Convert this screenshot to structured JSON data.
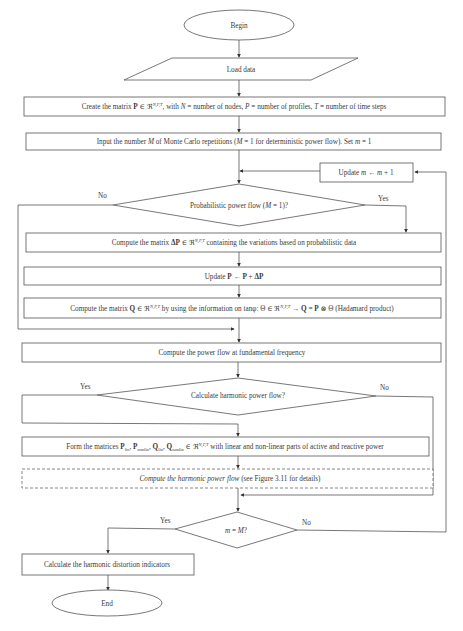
{
  "flowchart": {
    "nodes": {
      "begin": "Begin",
      "load_data": "Load data",
      "create_matrix": "Create the matrix P ∈ ℜ^(N,P,T), with N = number of nodes, P = number of profiles, T = number of time steps",
      "create_matrix_parts": {
        "a": "Create the matrix ",
        "b": "P",
        "c": " ∈ ℜ",
        "sup": "N,P,T",
        "d": ", with ",
        "n": "N",
        "e": " = number of nodes, ",
        "p": "P",
        "f": " = number of profiles, ",
        "t": "T",
        "g": " = number of time steps"
      },
      "input_m": {
        "a": "Input the number ",
        "M1": "M",
        "b": " of Monte Carlo repetitions (",
        "M2": "M",
        "c": " = 1 for deterministic power flow). Set ",
        "m": "m",
        "d": " = 1"
      },
      "update_m": {
        "a": "Update ",
        "m1": "m",
        "b": " ← ",
        "m2": "m",
        "c": " + 1"
      },
      "probabilistic_decision": {
        "a": "Probabilistic power flow (",
        "M": "M",
        "b": " = 1)?"
      },
      "compute_delta_p": {
        "a": "Compute the matrix ",
        "b": "ΔP",
        "c": " ∈ ℜ",
        "sup": "N,P,T",
        "d": " containing the variations based on probabilistic data"
      },
      "update_p": {
        "a": "Update ",
        "b": "P",
        "c": " ← ",
        "d": "P",
        "e": " + ",
        "f": "ΔP"
      },
      "compute_q": {
        "a": "Compute the matrix ",
        "b": "Q",
        "c": " ∈ ℜ",
        "sup1": "N,P,T",
        "d": " by using the information on tanφ: Θ ∈ ℜ",
        "sup2": "N,P,T",
        "e": " → ",
        "f": "Q",
        "g": " = ",
        "h": "P",
        "i": " ⊗ Θ (Hadamard product)"
      },
      "fundamental_pf": "Compute the power flow at fundamental frequency",
      "harmonic_decision": "Calculate harmonic power flow?",
      "form_matrices": {
        "a": "Form the matrices ",
        "p1": "P",
        "s1": "lin",
        "p2": "P",
        "s2": "nonlin",
        "q1": "Q",
        "s3": "lin",
        "q2": "Q",
        "s4": "nonlin",
        "c": " ∈ ℜ",
        "sup": "N,P,T",
        "d": " with linear and non-linear parts of active and reactive power"
      },
      "harmonic_pf": {
        "a": "Compute the harmonic power flow",
        "b": " (see Figure 3.11 for details)"
      },
      "m_equals_M": {
        "m": "m",
        "b": " = ",
        "M": "M",
        "c": "?"
      },
      "distortion": "Calculate the harmonic distortion indicators",
      "end": "End"
    },
    "edge_labels": {
      "prob_no": "No",
      "prob_yes": "Yes",
      "harm_yes": "Yes",
      "harm_no": "No",
      "loop_yes": "Yes",
      "loop_no": "No"
    },
    "colors": {
      "stroke": "#555555",
      "text": "#3a3a3a",
      "background": "#ffffff"
    }
  }
}
